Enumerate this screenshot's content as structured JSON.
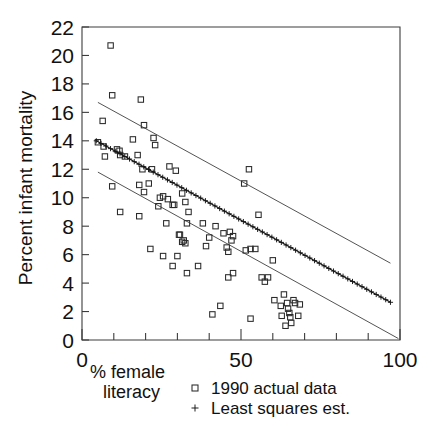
{
  "chart_data": {
    "type": "scatter",
    "title": "",
    "subtitle": "",
    "xlabel": "% female literacy",
    "xlabel_lines": [
      "% female",
      "literacy"
    ],
    "ylabel": "Percent infant mortality",
    "xlim": [
      0,
      100
    ],
    "ylim": [
      0,
      22
    ],
    "x_ticks_major": [
      0,
      50,
      100
    ],
    "x_ticklabels": [
      "0",
      "50",
      "100"
    ],
    "x_ticks_minor": [
      10,
      20,
      30,
      40,
      60,
      70,
      80,
      90
    ],
    "y_ticks": [
      0,
      2,
      4,
      6,
      8,
      10,
      12,
      14,
      16,
      18,
      20,
      22
    ],
    "y_ticklabels": [
      "0",
      "2",
      "4",
      "6",
      "8",
      "10",
      "12",
      "14",
      "16",
      "18",
      "20",
      "22"
    ],
    "grid": false,
    "legend_position": "below-right",
    "legend": [
      {
        "marker": "square",
        "label": "1990 actual data"
      },
      {
        "marker": "plus",
        "label": "Least squares est."
      }
    ],
    "series": [
      {
        "name": "1990 actual data",
        "marker": "square",
        "points": [
          [
            9.0,
            20.7
          ],
          [
            9.5,
            17.2
          ],
          [
            6.5,
            15.4
          ],
          [
            5.0,
            13.9
          ],
          [
            6.8,
            13.6
          ],
          [
            7.2,
            12.9
          ],
          [
            11.0,
            13.4
          ],
          [
            11.8,
            13.3
          ],
          [
            12.0,
            13.0
          ],
          [
            13.5,
            12.9
          ],
          [
            18.5,
            16.9
          ],
          [
            19.5,
            15.1
          ],
          [
            16.0,
            14.1
          ],
          [
            17.5,
            13.0
          ],
          [
            19.0,
            12.0
          ],
          [
            22.5,
            14.2
          ],
          [
            23.0,
            13.7
          ],
          [
            22.0,
            12.0
          ],
          [
            21.0,
            11.0
          ],
          [
            18.0,
            10.9
          ],
          [
            19.5,
            10.4
          ],
          [
            9.5,
            10.8
          ],
          [
            12.0,
            9.0
          ],
          [
            18.0,
            8.7
          ],
          [
            24.0,
            9.4
          ],
          [
            24.5,
            10.0
          ],
          [
            25.5,
            10.1
          ],
          [
            27.5,
            12.2
          ],
          [
            29.5,
            11.9
          ],
          [
            27.0,
            9.9
          ],
          [
            28.5,
            9.5
          ],
          [
            29.0,
            9.5
          ],
          [
            31.5,
            10.3
          ],
          [
            32.5,
            9.7
          ],
          [
            33.5,
            9.0
          ],
          [
            33.0,
            8.2
          ],
          [
            26.5,
            8.2
          ],
          [
            30.5,
            7.4
          ],
          [
            30.8,
            7.4
          ],
          [
            32.0,
            7.0
          ],
          [
            32.5,
            6.8
          ],
          [
            31.5,
            6.9
          ],
          [
            21.5,
            6.4
          ],
          [
            25.5,
            5.9
          ],
          [
            28.5,
            5.2
          ],
          [
            30.0,
            5.9
          ],
          [
            33.0,
            4.7
          ],
          [
            36.5,
            5.2
          ],
          [
            38.0,
            8.2
          ],
          [
            40.0,
            7.2
          ],
          [
            39.0,
            6.6
          ],
          [
            42.0,
            8.0
          ],
          [
            44.5,
            7.5
          ],
          [
            45.5,
            6.5
          ],
          [
            46.0,
            6.2
          ],
          [
            46.5,
            7.6
          ],
          [
            47.0,
            7.0
          ],
          [
            47.5,
            7.3
          ],
          [
            43.5,
            2.4
          ],
          [
            41.0,
            1.8
          ],
          [
            46.0,
            4.4
          ],
          [
            47.5,
            4.7
          ],
          [
            52.5,
            12.0
          ],
          [
            51.0,
            11.0
          ],
          [
            55.5,
            8.8
          ],
          [
            51.5,
            6.3
          ],
          [
            53.0,
            6.4
          ],
          [
            54.5,
            6.4
          ],
          [
            56.5,
            4.4
          ],
          [
            57.5,
            4.1
          ],
          [
            58.5,
            4.4
          ],
          [
            60.0,
            5.6
          ],
          [
            53.0,
            1.5
          ],
          [
            60.5,
            2.8
          ],
          [
            62.5,
            2.4
          ],
          [
            62.8,
            1.7
          ],
          [
            63.5,
            3.2
          ],
          [
            64.5,
            2.6
          ],
          [
            64.8,
            2.2
          ],
          [
            65.2,
            1.9
          ],
          [
            65.5,
            1.6
          ],
          [
            65.8,
            1.2
          ],
          [
            66.5,
            2.8
          ],
          [
            67.0,
            2.6
          ],
          [
            68.0,
            1.7
          ],
          [
            64.0,
            1.0
          ],
          [
            68.5,
            2.5
          ]
        ]
      },
      {
        "name": "Least squares est.",
        "marker": "plus",
        "fit_line": {
          "x_start": 4.5,
          "y_start": 14.0,
          "x_end": 97.0,
          "y_end": 2.65,
          "slope": -0.1227,
          "intercept": 14.55
        }
      }
    ],
    "confidence_bands": [
      {
        "name": "upper",
        "x_start": 5.0,
        "y_start": 16.7,
        "x_end": 97.0,
        "y_end": 5.4
      },
      {
        "name": "lower",
        "x_start": 5.0,
        "y_start": 11.8,
        "x_end": 99.5,
        "y_end": 0.1
      }
    ]
  }
}
